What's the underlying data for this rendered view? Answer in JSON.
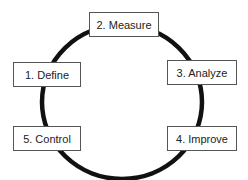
{
  "diagram": {
    "type": "cycle",
    "ring_color": "#111111",
    "steps": [
      {
        "label": "1. Define"
      },
      {
        "label": "2. Measure"
      },
      {
        "label": "3. Analyze"
      },
      {
        "label": "4. Improve"
      },
      {
        "label": "5. Control"
      }
    ]
  }
}
